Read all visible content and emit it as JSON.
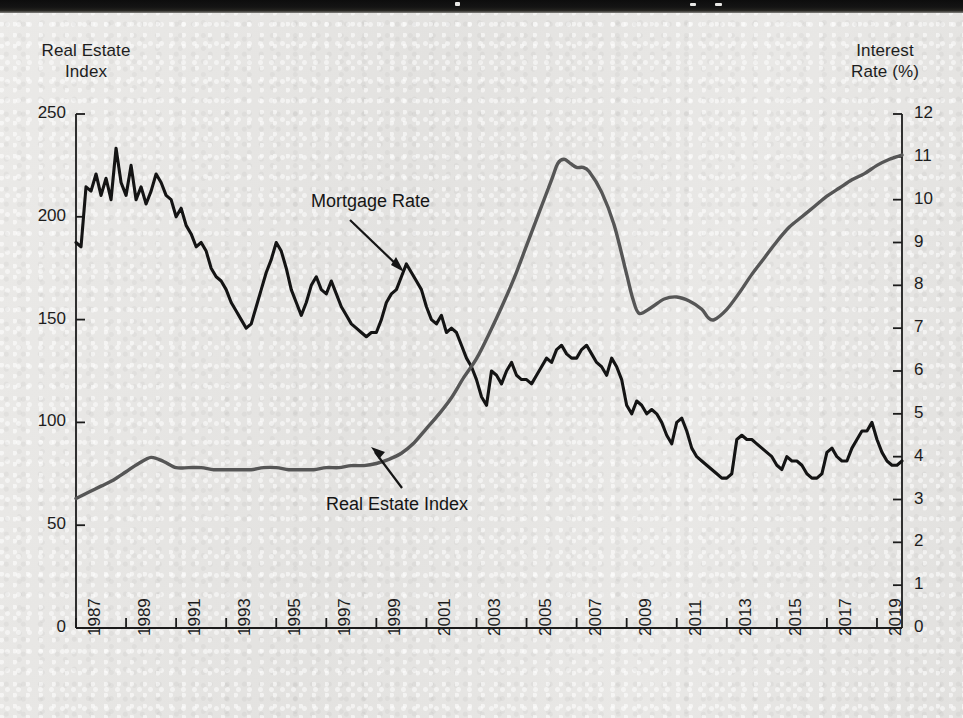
{
  "figure": {
    "background_color": "#e7e7e5",
    "top_band_color": "#111111",
    "left_axis_title": "Real Estate\nIndex",
    "left_axis_title_line1": "Real Estate",
    "left_axis_title_line2": "Index",
    "right_axis_title_line1": "Interest",
    "right_axis_title_line2": "Rate (%)"
  },
  "annotations": {
    "mortgage_rate_label": "Mortgage Rate",
    "real_estate_index_label": "Real Estate Index"
  },
  "chart_data": {
    "type": "line",
    "title": "",
    "subtitle": "",
    "xlabel": "",
    "ylabel": "Real Estate Index",
    "y2label": "Interest Rate (%)",
    "grid": false,
    "legend_position": "inline-annotations",
    "xlim": [
      1987,
      2020
    ],
    "ylim": [
      0,
      250
    ],
    "y2lim": [
      0,
      12
    ],
    "xticks": [
      1987,
      1989,
      1991,
      1993,
      1995,
      1997,
      1999,
      2001,
      2003,
      2005,
      2007,
      2009,
      2011,
      2013,
      2015,
      2017,
      2019
    ],
    "xticklabels": [
      "1987",
      "1989",
      "1991",
      "1993",
      "1995",
      "1997",
      "1999",
      "2001",
      "2003",
      "2005",
      "2007",
      "2009",
      "2011",
      "2013",
      "2015",
      "2017",
      "2019"
    ],
    "yticks": [
      0,
      50,
      100,
      150,
      200,
      250
    ],
    "yticklabels": [
      "0",
      "50",
      "100",
      "150",
      "200",
      "250"
    ],
    "y2ticks": [
      0,
      1,
      2,
      3,
      4,
      5,
      6,
      7,
      8,
      9,
      10,
      11,
      12
    ],
    "y2ticklabels": [
      "0",
      "1",
      "2",
      "3",
      "4",
      "5",
      "6",
      "7",
      "8",
      "9",
      "10",
      "11",
      "12"
    ],
    "series": [
      {
        "name": "Mortgage Rate",
        "axis": "right",
        "color": "#141414",
        "linewidth": 3.1,
        "units": "%",
        "x": [
          1987.0,
          1987.2,
          1987.4,
          1987.6,
          1987.8,
          1988.0,
          1988.2,
          1988.4,
          1988.6,
          1988.8,
          1989.0,
          1989.2,
          1989.4,
          1989.6,
          1989.8,
          1990.0,
          1990.2,
          1990.4,
          1990.6,
          1990.8,
          1991.0,
          1991.2,
          1991.4,
          1991.6,
          1991.8,
          1992.0,
          1992.2,
          1992.4,
          1992.6,
          1992.8,
          1993.0,
          1993.2,
          1993.4,
          1993.6,
          1993.8,
          1994.0,
          1994.2,
          1994.4,
          1994.6,
          1994.8,
          1995.0,
          1995.2,
          1995.4,
          1995.6,
          1995.8,
          1996.0,
          1996.2,
          1996.4,
          1996.6,
          1996.8,
          1997.0,
          1997.2,
          1997.4,
          1997.6,
          1997.8,
          1998.0,
          1998.2,
          1998.4,
          1998.6,
          1998.8,
          1999.0,
          1999.2,
          1999.4,
          1999.6,
          1999.8,
          2000.0,
          2000.2,
          2000.4,
          2000.6,
          2000.8,
          2001.0,
          2001.2,
          2001.4,
          2001.6,
          2001.8,
          2002.0,
          2002.2,
          2002.4,
          2002.6,
          2002.8,
          2003.0,
          2003.2,
          2003.4,
          2003.6,
          2003.8,
          2004.0,
          2004.2,
          2004.4,
          2004.6,
          2004.8,
          2005.0,
          2005.2,
          2005.4,
          2005.6,
          2005.8,
          2006.0,
          2006.2,
          2006.4,
          2006.6,
          2006.8,
          2007.0,
          2007.2,
          2007.4,
          2007.6,
          2007.8,
          2008.0,
          2008.2,
          2008.4,
          2008.6,
          2008.8,
          2009.0,
          2009.2,
          2009.4,
          2009.6,
          2009.8,
          2010.0,
          2010.2,
          2010.4,
          2010.6,
          2010.8,
          2011.0,
          2011.2,
          2011.4,
          2011.6,
          2011.8,
          2012.0,
          2012.2,
          2012.4,
          2012.6,
          2012.8,
          2013.0,
          2013.2,
          2013.4,
          2013.6,
          2013.8,
          2014.0,
          2014.2,
          2014.4,
          2014.6,
          2014.8,
          2015.0,
          2015.2,
          2015.4,
          2015.6,
          2015.8,
          2016.0,
          2016.2,
          2016.4,
          2016.6,
          2016.8,
          2017.0,
          2017.2,
          2017.4,
          2017.6,
          2017.8,
          2018.0,
          2018.2,
          2018.4,
          2018.6,
          2018.8,
          2019.0,
          2019.2,
          2019.4,
          2019.6,
          2019.8,
          2020.0
        ],
        "y": [
          9.0,
          8.9,
          10.3,
          10.2,
          10.6,
          10.1,
          10.5,
          10.0,
          11.2,
          10.4,
          10.1,
          10.8,
          10.0,
          10.3,
          9.9,
          10.2,
          10.6,
          10.4,
          10.1,
          10.0,
          9.6,
          9.8,
          9.4,
          9.2,
          8.9,
          9.0,
          8.8,
          8.4,
          8.2,
          8.1,
          7.9,
          7.6,
          7.4,
          7.2,
          7.0,
          7.1,
          7.5,
          7.9,
          8.3,
          8.6,
          9.0,
          8.8,
          8.4,
          7.9,
          7.6,
          7.3,
          7.6,
          8.0,
          8.2,
          7.9,
          7.8,
          8.1,
          7.8,
          7.5,
          7.3,
          7.1,
          7.0,
          6.9,
          6.8,
          6.9,
          6.9,
          7.2,
          7.6,
          7.8,
          7.9,
          8.2,
          8.5,
          8.3,
          8.1,
          7.9,
          7.5,
          7.2,
          7.1,
          7.3,
          6.9,
          7.0,
          6.9,
          6.6,
          6.3,
          6.1,
          5.8,
          5.4,
          5.2,
          6.0,
          5.9,
          5.7,
          6.0,
          6.2,
          5.9,
          5.8,
          5.8,
          5.7,
          5.9,
          6.1,
          6.3,
          6.2,
          6.5,
          6.6,
          6.4,
          6.3,
          6.3,
          6.5,
          6.6,
          6.4,
          6.2,
          6.1,
          5.9,
          6.3,
          6.1,
          5.8,
          5.2,
          5.0,
          5.3,
          5.2,
          5.0,
          5.1,
          5.0,
          4.8,
          4.5,
          4.3,
          4.8,
          4.9,
          4.6,
          4.2,
          4.0,
          3.9,
          3.8,
          3.7,
          3.6,
          3.5,
          3.5,
          3.6,
          4.4,
          4.5,
          4.4,
          4.4,
          4.3,
          4.2,
          4.1,
          4.0,
          3.8,
          3.7,
          4.0,
          3.9,
          3.9,
          3.8,
          3.6,
          3.5,
          3.5,
          3.6,
          4.1,
          4.2,
          4.0,
          3.9,
          3.9,
          4.2,
          4.4,
          4.6,
          4.6,
          4.8,
          4.4,
          4.1,
          3.9,
          3.8,
          3.8,
          3.9
        ]
      },
      {
        "name": "Real Estate Index",
        "axis": "left",
        "color": "#565656",
        "linewidth": 3.4,
        "units": "index",
        "x": [
          1987,
          1987.5,
          1988,
          1988.5,
          1989,
          1989.5,
          1990,
          1990.5,
          1991,
          1991.5,
          1992,
          1992.5,
          1993,
          1993.5,
          1994,
          1994.5,
          1995,
          1995.5,
          1996,
          1996.5,
          1997,
          1997.5,
          1998,
          1998.5,
          1999,
          1999.5,
          2000,
          2000.5,
          2001,
          2001.5,
          2002,
          2002.5,
          2003,
          2003.5,
          2004,
          2004.5,
          2005,
          2005.5,
          2006,
          2006.25,
          2006.5,
          2006.75,
          2007,
          2007.25,
          2007.5,
          2008,
          2008.5,
          2009,
          2009.25,
          2009.5,
          2010,
          2010.5,
          2011,
          2011.5,
          2012,
          2012.25,
          2012.5,
          2013,
          2013.5,
          2014,
          2014.5,
          2015,
          2015.5,
          2016,
          2016.5,
          2017,
          2017.5,
          2018,
          2018.5,
          2019,
          2019.5,
          2020
        ],
        "y": [
          63,
          66,
          69,
          72,
          76,
          80,
          83,
          81,
          78,
          78,
          78,
          77,
          77,
          77,
          77,
          78,
          78,
          77,
          77,
          77,
          78,
          78,
          79,
          79,
          80,
          82,
          85,
          90,
          97,
          104,
          112,
          122,
          131,
          143,
          156,
          170,
          186,
          202,
          218,
          226,
          228,
          226,
          224,
          224,
          222,
          212,
          196,
          172,
          160,
          153,
          156,
          160,
          161,
          159,
          155,
          151,
          150,
          155,
          163,
          172,
          180,
          188,
          195,
          200,
          205,
          210,
          214,
          218,
          221,
          225,
          228,
          230
        ]
      }
    ]
  }
}
